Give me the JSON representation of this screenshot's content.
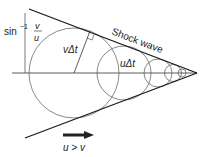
{
  "diagram": {
    "title_label": "Shock wave",
    "angle_label_prefix": "sin",
    "angle_label_exp": "−1",
    "angle_frac_num": "v",
    "angle_frac_den": "u",
    "radius_label": "vΔt",
    "distance_label": "uΔt",
    "condition_label": "u > v",
    "colors": {
      "line": "#1a1a1a",
      "circle": "#555555",
      "arrow": "#222222"
    }
  }
}
